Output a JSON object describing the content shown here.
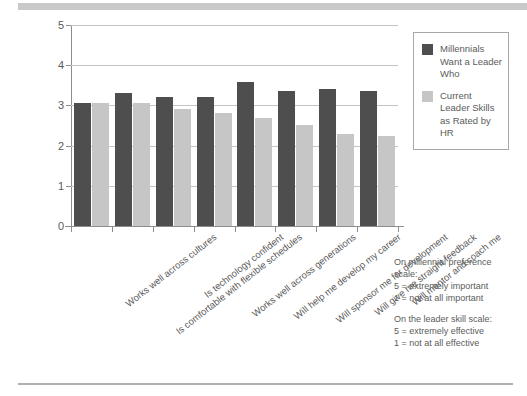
{
  "chart_data": {
    "type": "bar",
    "title": "",
    "xlabel": "",
    "ylabel": "",
    "ylim": [
      0,
      5
    ],
    "yticks": [
      0,
      1,
      2,
      3,
      4,
      5
    ],
    "grid": true,
    "legend_position": "right",
    "categories": [
      "Works well across cultures",
      "Is comfortable with flexible schedules",
      "Is technology confident",
      "Works well across generations",
      "Will help me develop my career",
      "Will sponsor me for development",
      "Will give me straight feedback",
      "Will mentor and coach me"
    ],
    "series": [
      {
        "name": "Millennials Want a Leader Who",
        "color": "#4e4e4e",
        "values": [
          3.05,
          3.3,
          3.2,
          3.2,
          3.58,
          3.35,
          3.4,
          3.35
        ]
      },
      {
        "name": "Current Leader Skills as Rated by HR",
        "color": "#c6c6c6",
        "values": [
          3.05,
          3.05,
          2.92,
          2.8,
          2.68,
          2.52,
          2.3,
          2.23
        ]
      }
    ]
  },
  "legend": {
    "items": [
      {
        "label": "Millennials Want a Leader Who",
        "swatch": "dark"
      },
      {
        "label": "Current Leader Skills as Rated by HR",
        "swatch": "light"
      }
    ]
  },
  "footnote": {
    "block1_line1": "On millennial preference",
    "block1_line2": "scale:",
    "block1_line3": "5 = extremely important",
    "block1_line4": "1 = not at all important",
    "block2_line1": "On the leader skill scale:",
    "block2_line2": "5 = extremely effective",
    "block2_line3": "1 = not at all effective"
  },
  "colors": {
    "series_dark": "#4e4e4e",
    "series_light": "#c6c6c6",
    "rule": "#c9c9c9",
    "axis": "#8d8d8d",
    "grid": "#c4c4c4",
    "text": "#5b5b5b"
  }
}
